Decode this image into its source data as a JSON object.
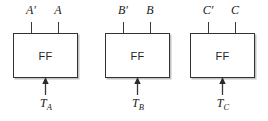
{
  "diagram": {
    "ff_label": "FF",
    "colors": {
      "box_stroke": "#333333",
      "line": "#3a3a3a",
      "text": "#1a1a1a",
      "background": "#ffffff",
      "shadow": "#787878"
    },
    "cells": [
      {
        "id": "cell-a",
        "ff_label": "FF",
        "output_complement": "A′",
        "output_normal": "A",
        "trigger_base": "T",
        "trigger_subscript": "A",
        "trigger_full": "Tₐ"
      },
      {
        "id": "cell-b",
        "ff_label": "FF",
        "output_complement": "B′",
        "output_normal": "B",
        "trigger_base": "T",
        "trigger_subscript": "B",
        "trigger_full": "Tʙ"
      },
      {
        "id": "cell-c",
        "ff_label": "FF",
        "output_complement": "C′",
        "output_normal": "C",
        "trigger_base": "T",
        "trigger_subscript": "C",
        "trigger_full": "Tᴄ"
      }
    ]
  }
}
